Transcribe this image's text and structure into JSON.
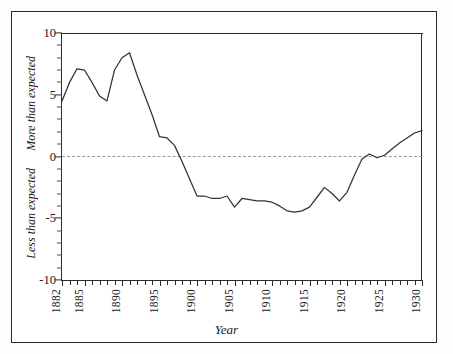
{
  "figure": {
    "clipped_header_text": "",
    "xlabel": "Year",
    "ylabel_upper": "More than expected",
    "ylabel_lower": "Less than expected",
    "zero_reference_line": "dashed"
  },
  "chart_data": {
    "type": "line",
    "title": "",
    "xlabel": "Year",
    "ylabel": "",
    "ylabel_upper": "More than expected",
    "ylabel_lower": "Less than expected",
    "xlim": [
      1882,
      1930
    ],
    "ylim": [
      -10,
      10
    ],
    "grid": false,
    "legend": "none",
    "y_ticks": [
      10,
      5,
      0,
      -5,
      -10
    ],
    "y_tick_labels": [
      "10",
      "5",
      "0",
      "-5",
      "-10"
    ],
    "x_ticks": [
      1882,
      1885,
      1890,
      1895,
      1900,
      1905,
      1910,
      1915,
      1920,
      1925,
      1930
    ],
    "x_tick_labels": [
      "1882",
      "1885",
      "1890",
      "1895",
      "1900",
      "1905",
      "1910",
      "1915",
      "1920",
      "1925",
      "1930"
    ],
    "x_minor_tick_interval": 1,
    "reference_lines": [
      {
        "y": 0,
        "style": "dashed",
        "color": "#9a9a9a"
      }
    ],
    "line_color": "#333333",
    "series": [
      {
        "name": "Deviation from expected",
        "x": [
          1882,
          1883,
          1884,
          1885,
          1886,
          1887,
          1888,
          1889,
          1890,
          1891,
          1892,
          1893,
          1894,
          1895,
          1896,
          1897,
          1898,
          1899,
          1900,
          1901,
          1902,
          1903,
          1904,
          1905,
          1906,
          1907,
          1908,
          1909,
          1910,
          1911,
          1912,
          1913,
          1914,
          1915,
          1916,
          1917,
          1918,
          1919,
          1920,
          1921,
          1922,
          1923,
          1924,
          1925,
          1926,
          1927,
          1928,
          1929,
          1930
        ],
        "values": [
          4.5,
          6.0,
          7.1,
          7.0,
          6.0,
          4.9,
          4.5,
          7.0,
          8.0,
          8.4,
          6.6,
          5.0,
          3.4,
          1.6,
          1.5,
          0.9,
          -0.4,
          -1.8,
          -3.2,
          -3.2,
          -3.4,
          -3.4,
          -3.2,
          -4.1,
          -3.4,
          -3.5,
          -3.6,
          -3.6,
          -3.7,
          -4.0,
          -4.4,
          -4.5,
          -4.4,
          -4.1,
          -3.3,
          -2.5,
          -3.0,
          -3.6,
          -2.9,
          -1.5,
          -0.2,
          0.2,
          -0.1,
          0.1,
          0.6,
          1.1,
          1.5,
          1.9,
          2.1
        ]
      }
    ]
  }
}
